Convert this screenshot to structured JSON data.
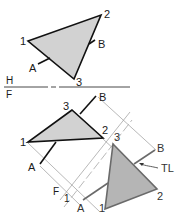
{
  "diagram": {
    "type": "descriptive-geometry-auxiliary-view",
    "colors": {
      "fill_top": "#cfcfcf",
      "fill_aux": "#b8b8b8",
      "edge_dark": "#111111",
      "edge_grey": "#666666",
      "projector": "#9a9a9a"
    },
    "fold_lines": {
      "hf": {
        "upper": "H",
        "lower": "F"
      },
      "f1": {
        "label_f": "F",
        "label_1": "1"
      }
    },
    "top_view": {
      "vertices": {
        "v1": "1",
        "v2": "2",
        "v3": "3"
      },
      "points": {
        "a": "A",
        "b": "B"
      }
    },
    "front_view": {
      "vertices": {
        "v1": "1",
        "v2": "2",
        "v3": "3"
      },
      "points": {
        "a": "A",
        "b": "B"
      }
    },
    "aux_view": {
      "vertices": {
        "v1": "1",
        "v2": "2",
        "v3": "3"
      },
      "points": {
        "a": "A",
        "b": "B"
      },
      "annotation": "TL"
    }
  }
}
